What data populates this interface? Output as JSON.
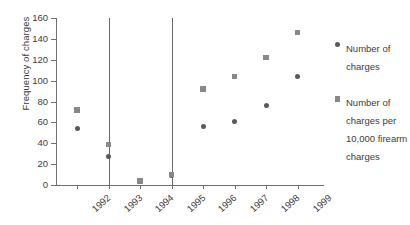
{
  "chart_data": {
    "type": "scatter",
    "title": "",
    "xlabel": "",
    "ylabel": "Frequency of charges",
    "categories": [
      "1992",
      "1993",
      "1994",
      "1995",
      "1996",
      "1997",
      "1998",
      "1999"
    ],
    "ylim": [
      0,
      160
    ],
    "yticks": [
      0,
      20,
      40,
      60,
      80,
      100,
      120,
      140,
      160
    ],
    "grid": false,
    "legend_position": "right",
    "series": [
      {
        "name": "Number of charges",
        "marker": "circle",
        "color": "#595959",
        "values": [
          54,
          27,
          null,
          9,
          56,
          61,
          76,
          104
        ]
      },
      {
        "name": "Number of charges per 10,000 firearm charges",
        "marker": "square",
        "color": "#888888",
        "values": [
          72,
          39,
          4,
          10,
          92,
          104,
          122,
          146
        ]
      }
    ],
    "reference_lines": [
      {
        "at": "1993",
        "orientation": "vertical",
        "top_value": 160
      },
      {
        "at": "1995",
        "orientation": "vertical",
        "top_value": 160
      }
    ]
  },
  "axis": {
    "y_title": "Frequency of charges",
    "y_tick_labels": [
      "160",
      "140",
      "120",
      "100",
      "80",
      "60",
      "40",
      "20",
      "0"
    ],
    "x_tick_labels": [
      "1992",
      "1993",
      "1994",
      "1995",
      "1996",
      "1997",
      "1998",
      "1999"
    ]
  },
  "legend": {
    "entries": [
      {
        "label": "Number of charges",
        "marker": "circle-marker-icon"
      },
      {
        "label": "Number of charges per 10,000 firearm charges",
        "marker": "square-marker-icon"
      }
    ]
  }
}
